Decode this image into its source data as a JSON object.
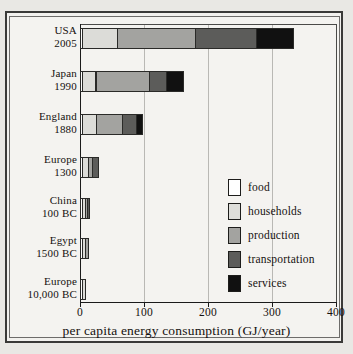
{
  "chart_data": {
    "type": "bar",
    "orientation": "horizontal",
    "stacked": true,
    "title": "",
    "xlabel": "per capita energy consumption (GJ/year)",
    "ylabel": "",
    "xlim": [
      0,
      400
    ],
    "xticks": [
      0,
      100,
      200,
      300,
      400
    ],
    "xticklabels": [
      "0",
      "100",
      "200",
      "300",
      "400"
    ],
    "grid": "vertical",
    "legend_position": "center-right",
    "categories": [
      {
        "name": "USA",
        "period": "2005"
      },
      {
        "name": "Japan",
        "period": "1990"
      },
      {
        "name": "England",
        "period": "1880"
      },
      {
        "name": "Europe",
        "period": "1300"
      },
      {
        "name": "China",
        "period": "100 BC"
      },
      {
        "name": "Egypt",
        "period": "1500 BC"
      },
      {
        "name": "Europe",
        "period": "10,000 BC"
      }
    ],
    "series": [
      {
        "name": "food",
        "color": "#ffffff",
        "values": [
          4,
          4,
          5,
          5,
          5,
          5,
          5
        ]
      },
      {
        "name": "households",
        "color": "#dcdcd8",
        "values": [
          57,
          23,
          23,
          10,
          5,
          6,
          6
        ]
      },
      {
        "name": "production",
        "color": "#a3a3a0",
        "values": [
          123,
          85,
          42,
          8,
          5,
          5,
          0
        ]
      },
      {
        "name": "transportation",
        "color": "#5c5c5a",
        "values": [
          96,
          28,
          23,
          10,
          5,
          0,
          0
        ]
      },
      {
        "name": "services",
        "color": "#111111",
        "values": [
          60,
          28,
          10,
          0,
          0,
          0,
          0
        ]
      }
    ],
    "totals": [
      340,
      168,
      103,
      33,
      20,
      16,
      11
    ]
  },
  "legend": {
    "items": [
      {
        "label": "food",
        "swatch": "food"
      },
      {
        "label": "households",
        "swatch": "households"
      },
      {
        "label": "production",
        "swatch": "production"
      },
      {
        "label": "transportation",
        "swatch": "transportation"
      },
      {
        "label": "services",
        "swatch": "services"
      }
    ]
  }
}
